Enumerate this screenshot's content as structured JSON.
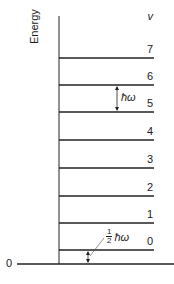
{
  "diagram": {
    "y_axis_label": "Energy",
    "quantum_number_label": "v",
    "baseline_label": "0",
    "levels": [
      {
        "v": "7",
        "y": 58
      },
      {
        "v": "6",
        "y": 85
      },
      {
        "v": "5",
        "y": 112
      },
      {
        "v": "4",
        "y": 140
      },
      {
        "v": "3",
        "y": 168
      },
      {
        "v": "2",
        "y": 196
      },
      {
        "v": "1",
        "y": 223
      },
      {
        "v": "0",
        "y": 250
      }
    ],
    "spacing_annotation": "ħω",
    "zero_point_annotation": {
      "fraction_num": "1",
      "fraction_den": "2",
      "symbol": "ħω"
    }
  }
}
